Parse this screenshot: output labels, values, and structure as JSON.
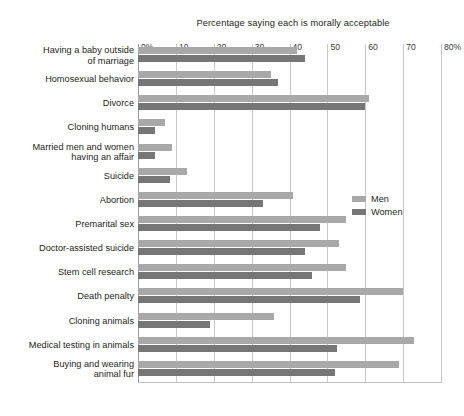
{
  "chart_data": {
    "type": "bar",
    "orientation": "horizontal",
    "title": "Percentage saying each is morally acceptable",
    "xlabel": "",
    "ylabel": "",
    "xlim": [
      0,
      80
    ],
    "grid": true,
    "legend_position": "center-right",
    "tick_labels": [
      "0%",
      "10",
      "20",
      "30",
      "40",
      "50",
      "60",
      "70",
      "80%"
    ],
    "tick_values": [
      0,
      10,
      20,
      30,
      40,
      50,
      60,
      70,
      80
    ],
    "categories": [
      "Having a baby outside\nof marriage",
      "Homosexual behavior",
      "Divorce",
      "Cloning humans",
      "Married men and women\nhaving an affair",
      "Suicide",
      "Abortion",
      "Premarital sex",
      "Doctor-assisted suicide",
      "Stem cell research",
      "Death penalty",
      "Cloning animals",
      "Medical testing in animals",
      "Buying and wearing\nanimal fur"
    ],
    "series": [
      {
        "name": "Men",
        "color": "#a8a8a8",
        "values": [
          42,
          35,
          61,
          7,
          9,
          13,
          41,
          55,
          53,
          55,
          70,
          36,
          73,
          69
        ]
      },
      {
        "name": "Women",
        "color": "#767676",
        "values": [
          44,
          37,
          60,
          4.5,
          4.5,
          8.5,
          33,
          48,
          44,
          46,
          58.5,
          19,
          52.5,
          52
        ]
      }
    ]
  },
  "caption": {
    "text": ""
  }
}
